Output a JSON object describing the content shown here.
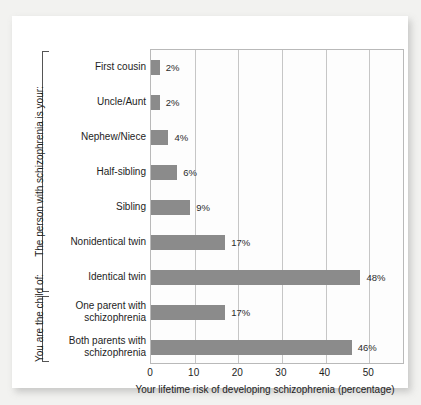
{
  "chart_data": {
    "type": "bar",
    "orientation": "horizontal",
    "title": "",
    "xlabel": "Your lifetime risk of developing schizophrenia (percentage)",
    "ylabel": "",
    "xlim": [
      0,
      58.2
    ],
    "xticks": [
      0,
      10,
      20,
      30,
      40,
      50
    ],
    "xticklabels": [
      "0",
      "10",
      "20",
      "30",
      "40",
      "50"
    ],
    "grid": "vertical",
    "legend": "none",
    "bar_color": "#8b8b8b",
    "categories": [
      "First cousin",
      "Uncle/Aunt",
      "Nephew/Niece",
      "Half-sibling",
      "Sibling",
      "Nonidentical twin",
      "Identical twin",
      "One parent with\nschizophrenia",
      "Both parents with\nschizophrenia"
    ],
    "values": [
      2,
      2,
      4,
      6,
      9,
      17,
      48,
      17,
      46
    ],
    "data_labels": [
      "2%",
      "2%",
      "4%",
      "6%",
      "9%",
      "17%",
      "48%",
      "17%",
      "46%"
    ],
    "groups": [
      {
        "label": "The person with schizophrenia is your:",
        "categories": [
          "First cousin",
          "Uncle/Aunt",
          "Nephew/Niece",
          "Half-sibling",
          "Sibling",
          "Nonidentical twin",
          "Identical twin"
        ]
      },
      {
        "label": "You are the child of:",
        "categories": [
          "One parent with schizophrenia",
          "Both parents with schizophrenia"
        ]
      }
    ]
  },
  "axis": {
    "x_title": "Your lifetime risk of developing schizophrenia (percentage)",
    "ticks": [
      "0",
      "10",
      "20",
      "30",
      "40",
      "50"
    ]
  },
  "groups": {
    "top_label": "The person with schizophrenia is your:",
    "bottom_label": "You are the child of:"
  },
  "rows": [
    {
      "label": "First cousin",
      "value": 2,
      "data_label": "2%"
    },
    {
      "label": "Uncle/Aunt",
      "value": 2,
      "data_label": "2%"
    },
    {
      "label": "Nephew/Niece",
      "value": 4,
      "data_label": "4%"
    },
    {
      "label": "Half-sibling",
      "value": 6,
      "data_label": "6%"
    },
    {
      "label": "Sibling",
      "value": 9,
      "data_label": "9%"
    },
    {
      "label": "Nonidentical twin",
      "value": 17,
      "data_label": "17%"
    },
    {
      "label": "Identical twin",
      "value": 48,
      "data_label": "48%"
    },
    {
      "label": "One parent with\nschizophrenia",
      "value": 17,
      "data_label": "17%"
    },
    {
      "label": "Both parents with\nschizophrenia",
      "value": 46,
      "data_label": "46%"
    }
  ],
  "colors": {
    "bar": "#8b8b8b",
    "grid": "#c6c6c6",
    "frame": "#b9b9b9",
    "text": "#1d1d1d",
    "card": "#ffffff",
    "page": "#f2f2f0"
  }
}
